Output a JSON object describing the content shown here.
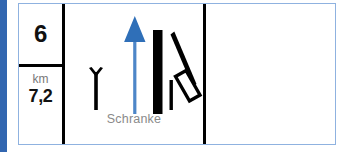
{
  "accent": {
    "color": "#3266b0"
  },
  "frame": {
    "border_color": "#8fb2e0",
    "divider_color": "#000000"
  },
  "km_marker": {
    "number": "6",
    "unit_label": "km",
    "value": "7,2"
  },
  "symbol_cell": {
    "caption": "Schranke",
    "caption_color": "#8a8a8a",
    "icons": [
      {
        "name": "signal-post-icon",
        "color": "#000000"
      },
      {
        "name": "direction-arrow-up-icon",
        "color": "#4d86c8"
      },
      {
        "name": "track-bar-icon",
        "color": "#000000"
      },
      {
        "name": "barrier-boom-icon",
        "color": "#000000"
      }
    ]
  },
  "empty_cell": {
    "content": ""
  }
}
